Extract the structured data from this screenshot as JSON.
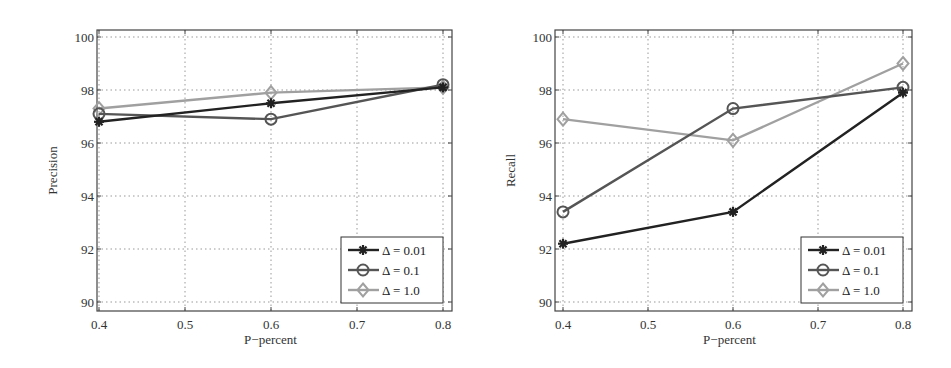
{
  "chart_data": [
    {
      "type": "line",
      "title": "",
      "xlabel": "P−percent",
      "ylabel": "Precision",
      "x": [
        0.4,
        0.6,
        0.8
      ],
      "xticks": [
        "0.4",
        "0.5",
        "0.6",
        "0.7",
        "0.8"
      ],
      "yticks": [
        "90",
        "92",
        "94",
        "96",
        "98",
        "100"
      ],
      "xlim": [
        0.4,
        0.8
      ],
      "ylim": [
        90,
        100
      ],
      "grid": true,
      "legend_position": "lower right",
      "series": [
        {
          "name": "Δ = 0.01",
          "marker": "asterisk",
          "color": "#222222",
          "values": [
            96.8,
            97.5,
            98.1
          ]
        },
        {
          "name": "Δ = 0.1",
          "marker": "circle",
          "color": "#555555",
          "values": [
            97.1,
            96.9,
            98.2
          ]
        },
        {
          "name": "Δ = 1.0",
          "marker": "diamond",
          "color": "#a0a0a0",
          "values": [
            97.3,
            97.9,
            98.1
          ]
        }
      ]
    },
    {
      "type": "line",
      "title": "",
      "xlabel": "P−percent",
      "ylabel": "Recall",
      "x": [
        0.4,
        0.6,
        0.8
      ],
      "xticks": [
        "0.4",
        "0.5",
        "0.6",
        "0.7",
        "0.8"
      ],
      "yticks": [
        "90",
        "92",
        "94",
        "96",
        "98",
        "100"
      ],
      "xlim": [
        0.4,
        0.8
      ],
      "ylim": [
        90,
        100
      ],
      "grid": true,
      "legend_position": "lower right",
      "series": [
        {
          "name": "Δ = 0.01",
          "marker": "asterisk",
          "color": "#222222",
          "values": [
            92.2,
            93.4,
            97.9
          ]
        },
        {
          "name": "Δ = 0.1",
          "marker": "circle",
          "color": "#555555",
          "values": [
            93.4,
            97.3,
            98.1
          ]
        },
        {
          "name": "Δ = 1.0",
          "marker": "diamond",
          "color": "#a0a0a0",
          "values": [
            96.9,
            96.1,
            99.0
          ]
        }
      ]
    }
  ]
}
